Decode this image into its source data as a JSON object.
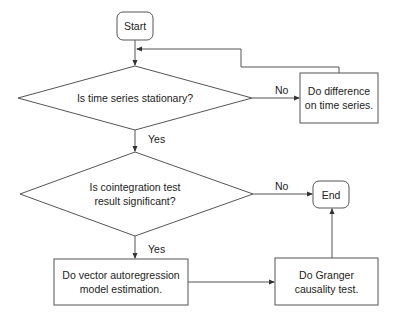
{
  "diagram": {
    "type": "flowchart",
    "nodes": {
      "start": {
        "label": "Start",
        "shape": "rounded-rect"
      },
      "stationary": {
        "label": "Is time series stationary?",
        "shape": "diamond"
      },
      "difference": {
        "line1": "Do difference",
        "line2": "on time series.",
        "shape": "rect"
      },
      "cointegration": {
        "line1": "Is cointegration test",
        "line2": "result significant?",
        "shape": "diamond"
      },
      "end": {
        "label": "End",
        "shape": "rounded-rect"
      },
      "var": {
        "line1": "Do vector autoregression",
        "line2": "model estimation.",
        "shape": "rect"
      },
      "granger": {
        "line1": "Do Granger",
        "line2": "causality test.",
        "shape": "rect"
      }
    },
    "edges": {
      "stationary_no": "No",
      "stationary_yes": "Yes",
      "cointegration_no": "No",
      "cointegration_yes": "Yes"
    },
    "colors": {
      "stroke": "#555555",
      "text": "#222222",
      "background": "#ffffff"
    }
  }
}
